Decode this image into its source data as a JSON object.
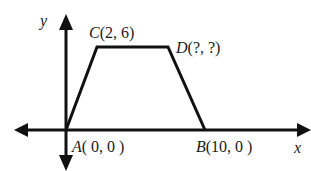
{
  "diagram": {
    "type": "coordinate-plane-trapezoid",
    "axes": {
      "x_label": "x",
      "y_label": "y"
    },
    "points": {
      "A": {
        "name": "A",
        "coords": "( 0, 0 )"
      },
      "B": {
        "name": "B",
        "coords": "(10, 0 )"
      },
      "C": {
        "name": "C",
        "coords": "(2, 6)"
      },
      "D": {
        "name": "D",
        "coords": "(?, ?)"
      }
    },
    "colors": {
      "line": "#111111",
      "background": "#ffffff"
    }
  }
}
